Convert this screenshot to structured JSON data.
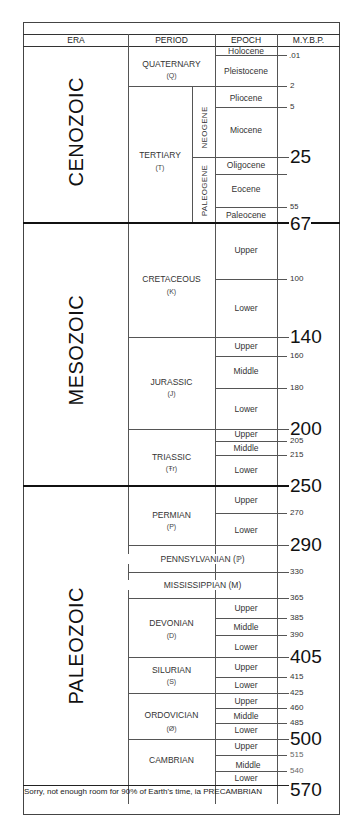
{
  "header": {
    "era": "ERA",
    "period": "PERIOD",
    "epoch": "EPOCH",
    "mybp": "M.Y.B.P."
  },
  "eras": {
    "cenozoic": "CENOZOIC",
    "mesozoic": "MESOZOIC",
    "paleozoic": "PALEOZOIC"
  },
  "periods": {
    "quaternary": {
      "name": "QUATERNARY",
      "abbr": "(Q)"
    },
    "tertiary": {
      "name": "TERTIARY",
      "abbr": "(T)"
    },
    "cretaceous": {
      "name": "CRETACEOUS",
      "abbr": "(K)"
    },
    "jurassic": {
      "name": "JURASSIC",
      "abbr": "(J)"
    },
    "triassic": {
      "name": "TRIASSIC",
      "abbr": "(Ŧr)"
    },
    "permian": {
      "name": "PERMIAN",
      "abbr": "(P)"
    },
    "pennsylvanian": {
      "name": "PENNSYLVANIAN (ℙ)"
    },
    "mississippian": {
      "name": "MISSISSIPPIAN (M)"
    },
    "devonian": {
      "name": "DEVONIAN",
      "abbr": "(D)"
    },
    "silurian": {
      "name": "SILURIAN",
      "abbr": "(S)"
    },
    "ordovician": {
      "name": "ORDOVICIAN",
      "abbr": "(Ø)"
    },
    "cambrian": {
      "name": "CAMBRIAN"
    }
  },
  "subperiods": {
    "neogene": "NEOGENE",
    "paleogene": "PALEOGENE"
  },
  "epochs": {
    "holocene": "Holocene",
    "pleistocene": "Pleistocene",
    "pliocene": "Pliocene",
    "miocene": "Miocene",
    "oligocene": "Oligocene",
    "eocene": "Eocene",
    "paleocene": "Paleocene",
    "upper": "Upper",
    "middle": "Middle",
    "lower": "Lower"
  },
  "mybp": {
    "v001": ".01",
    "v2": "2",
    "v5": "5",
    "v25": "25",
    "v55": "55",
    "v67": "67",
    "v100": "100",
    "v140": "140",
    "v160": "160",
    "v180": "180",
    "v200": "200",
    "v205": "205",
    "v215": "215",
    "v250": "250",
    "v270": "270",
    "v290": "290",
    "v330": "330",
    "v365": "365",
    "v385": "385",
    "v390": "390",
    "v405": "405",
    "v415": "415",
    "v425": "425",
    "v460": "460",
    "v485": "485",
    "v500": "500",
    "v515": "515",
    "v540": "540",
    "v570": "570"
  },
  "footer": "Sorry, not enough room for 90% of Earth's time, ia PRECAMBRIAN"
}
